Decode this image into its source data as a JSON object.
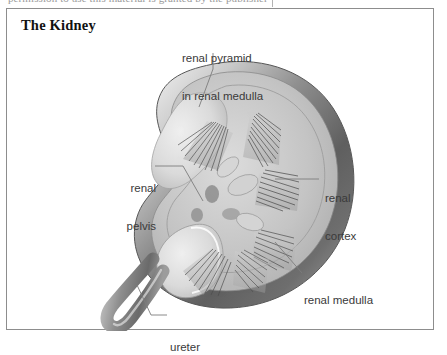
{
  "page": {
    "top_cut_text": "permission to use this material is granted by the publisher",
    "background_color": "#ffffff"
  },
  "figure": {
    "title": "The Kidney",
    "frame_color": "#8d8d8d",
    "labels": [
      {
        "id": "renal-pyramid",
        "line1": "renal pyramid",
        "line2": "in renal medulla",
        "leader": "vertical-down-left"
      },
      {
        "id": "renal-pelvis",
        "line1": "renal",
        "line2": "pelvis",
        "leader": "horizontal-right-then-down"
      },
      {
        "id": "renal-cortex",
        "line1": "renal",
        "line2": "cortex",
        "leader": "horizontal-left"
      },
      {
        "id": "renal-medulla",
        "line1": "renal medulla",
        "line2": "",
        "leader": "diagonal-up-left"
      },
      {
        "id": "ureter",
        "line1": "ureter",
        "line2": "",
        "leader": "short-left-then-up"
      }
    ],
    "anatomy": {
      "outer_cortex_color": "#6f6f6f",
      "capsule_highlight_color": "#d8d8d8",
      "medulla_color": "#b3b3b3",
      "pelvis_color": "#e2e2e2",
      "pyramid_stripe_color": "#4a4a4a",
      "ureter_color": "#9b9b9b"
    }
  }
}
